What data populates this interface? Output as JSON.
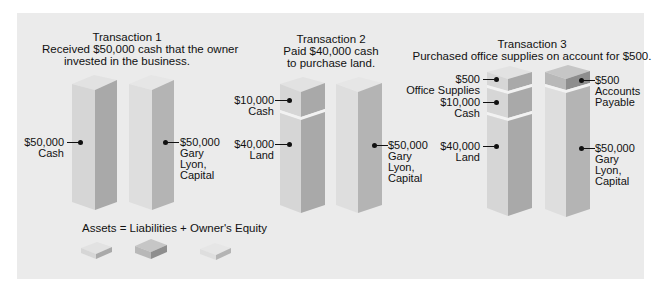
{
  "colors": {
    "panel_bg": "#ebebeb",
    "asset_front": "#d6d6d6",
    "asset_side": "#a9a9a9",
    "asset_top": "#e2e2e2",
    "liab_front": "#b8b8b8",
    "liab_side": "#8e8e8e",
    "liab_top": "#c6c6c6",
    "equity_front": "#dedede",
    "equity_side": "#b4b4b4",
    "equity_top": "#e6e6e6",
    "divider": "#f2f2f2",
    "text": "#111111"
  },
  "transactions": [
    {
      "title": "Transaction 1",
      "desc_line1": "Received $50,000 cash that the owner",
      "desc_line2": "invested in the business.",
      "assets": [
        {
          "amount": "$50,000",
          "name": "Cash"
        }
      ],
      "right": [
        {
          "amount": "$50,000",
          "name_line1": "Gary",
          "name_line2": "Lyon,",
          "name_line3": "Capital"
        }
      ]
    },
    {
      "title": "Transaction 2",
      "desc_line1": "Paid $40,000 cash",
      "desc_line2": "to purchase land.",
      "assets": [
        {
          "amount": "$10,000",
          "name": "Cash"
        },
        {
          "amount": "$40,000",
          "name": "Land"
        }
      ],
      "right": [
        {
          "amount": "$50,000",
          "name_line1": "Gary",
          "name_line2": "Lyon,",
          "name_line3": "Capital"
        }
      ]
    },
    {
      "title": "Transaction 3",
      "desc_line1": "Purchased office supplies on account for $500.",
      "assets": [
        {
          "amount": "$500",
          "name": "Office Supplies"
        },
        {
          "amount": "$10,000",
          "name": "Cash"
        },
        {
          "amount": "$40,000",
          "name": "Land"
        }
      ],
      "right": [
        {
          "amount": "$500",
          "name_line1": "Accounts",
          "name_line2": "Payable"
        },
        {
          "amount": "$50,000",
          "name_line1": "Gary",
          "name_line2": "Lyon,",
          "name_line3": "Capital"
        }
      ]
    }
  ],
  "legend": {
    "equation": "Assets = Liabilities + Owner's Equity",
    "items": [
      "Assets",
      "Liabilities",
      "Owner's Equity"
    ]
  }
}
